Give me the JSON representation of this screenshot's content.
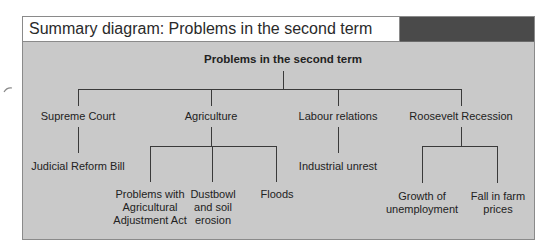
{
  "header": {
    "title": "Summary diagram: Problems in the second term"
  },
  "diagram": {
    "root": "Problems in the second term",
    "branches": [
      {
        "label": "Supreme Court",
        "children": [
          "Judicial Reform Bill"
        ]
      },
      {
        "label": "Agriculture",
        "children": [
          [
            "Problems with",
            "Agricultural",
            "Adjustment Act"
          ],
          [
            "Dustbowl",
            "and soil",
            "erosion"
          ],
          [
            "Floods"
          ]
        ]
      },
      {
        "label": "Labour relations",
        "children": [
          "Industrial unrest"
        ]
      },
      {
        "label": "Roosevelt Recession",
        "children": [
          [
            "Growth of",
            "unemployment"
          ],
          [
            "Fall in farm",
            "prices"
          ]
        ]
      }
    ]
  },
  "colors": {
    "panel_bg": "#c9c9c9",
    "header_bg": "#ffffff",
    "header_dark": "#4a4a4a",
    "line": "#3a3a3a"
  }
}
